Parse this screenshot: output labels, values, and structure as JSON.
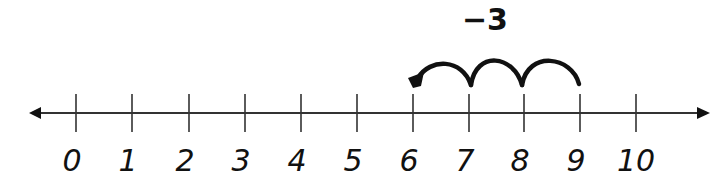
{
  "diagram": {
    "type": "number-line",
    "operation_label": "−3",
    "operation": "subtract",
    "start_value": 9,
    "end_value": 6,
    "jump_count": 3,
    "jump_size": 1,
    "tick_labels": [
      "0",
      "1",
      "2",
      "3",
      "4",
      "5",
      "6",
      "7",
      "8",
      "9",
      "10"
    ],
    "range": [
      0,
      10
    ],
    "arrows_both_ends": true,
    "jumps": [
      {
        "from": 9,
        "to": 8
      },
      {
        "from": 8,
        "to": 7
      },
      {
        "from": 7,
        "to": 6
      }
    ],
    "colors": {
      "line": "#333333",
      "ink": "#111111",
      "background": "#ffffff"
    }
  }
}
